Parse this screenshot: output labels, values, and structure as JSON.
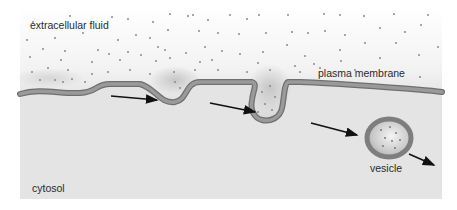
{
  "figure": {
    "labels": {
      "extracellular": "extracellular fluid",
      "membrane": "plasma membrane",
      "vesicle": "vesicle",
      "cytosol": "cytosol"
    },
    "colors": {
      "cytosol": "#e4e4e4",
      "extracellular_top": "#ffffff",
      "extracellular_shade": "#cfcfcf",
      "membrane": "#8e8e8e",
      "membrane_edge": "#6f6f6f",
      "particle": "#8a8a8a",
      "arrow": "#111111"
    },
    "stages": [
      "flat membrane",
      "shallow pit",
      "deep invagination",
      "free vesicle"
    ],
    "arrow_count": 4
  }
}
